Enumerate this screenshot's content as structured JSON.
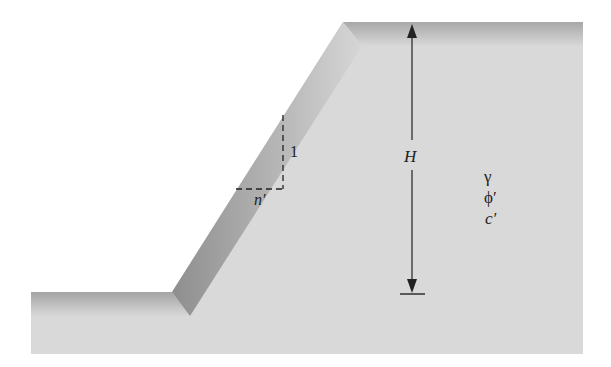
{
  "diagram": {
    "type": "slope-cross-section",
    "labels": {
      "height": "H",
      "slope_rise": "1",
      "slope_run": "n′",
      "unit_weight": "γ",
      "friction_angle": "ϕ′",
      "cohesion": "c′"
    },
    "colors": {
      "soil_fill": "#d9d9d9",
      "soil_edge_dark": "#9a9a9a",
      "line": "#222222",
      "background": "#ffffff"
    }
  }
}
